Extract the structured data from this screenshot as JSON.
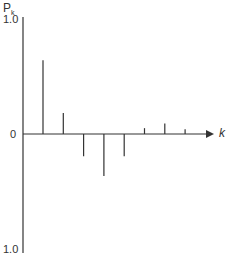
{
  "chart_data": {
    "type": "stem",
    "title": "",
    "ylabel": "P",
    "ylabel_subscript": "k",
    "xlabel": "k",
    "ylim": [
      -1.0,
      1.0
    ],
    "yticks": [
      "1.0",
      "0",
      "1.0"
    ],
    "x": [
      1,
      2,
      3,
      4,
      5,
      6,
      7,
      8
    ],
    "values": [
      0.63,
      0.18,
      -0.19,
      -0.36,
      -0.19,
      0.05,
      0.09,
      0.04
    ],
    "grid": false,
    "legend": null
  },
  "labels": {
    "ylabel": "P",
    "ylabel_sub": "k",
    "ytop": "1.0",
    "yzero": "0",
    "ybottom": "1.0",
    "xlabel": "k"
  },
  "colors": {
    "line": "#333333"
  }
}
